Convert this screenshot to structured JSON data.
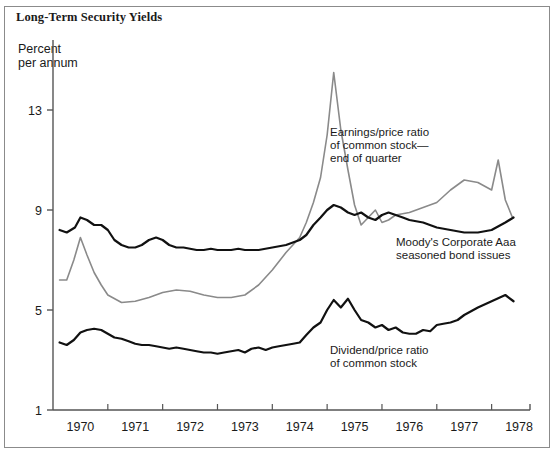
{
  "figure": {
    "title": "Long-Term Security Yields",
    "axis_unit_line1": "Percent",
    "axis_unit_line2": "per annum"
  },
  "colors": {
    "background": "#ffffff",
    "frame": "#8b8b8b",
    "axis": "#555555",
    "text": "#1a1a1a",
    "series_dark": "#111111",
    "series_gray": "#8a8a8a"
  },
  "chart_data": {
    "type": "line",
    "title": "Long-Term Security Yields",
    "xlabel": "",
    "ylabel": "Percent per annum",
    "xlim": [
      1969.5,
      1978.2
    ],
    "ylim": [
      1,
      15
    ],
    "yticks": [
      1,
      5,
      9,
      13
    ],
    "ytick_labels": [
      "1",
      "5",
      "9",
      "13"
    ],
    "xticks": [
      1970,
      1971,
      1972,
      1973,
      1974,
      1975,
      1976,
      1977,
      1978
    ],
    "xtick_labels": [
      "1970",
      "1971",
      "1972",
      "1973",
      "1974",
      "1975",
      "1976",
      "1977",
      "1978"
    ],
    "grid": false,
    "legend_position": "inline-annotations",
    "annotations": [
      {
        "name": "earnings-price-ratio",
        "lines": [
          "Earnings/price ratio",
          "of common stock—",
          "end of quarter"
        ],
        "x": 330,
        "y": 136
      },
      {
        "name": "moodys-corporate-aaa",
        "lines": [
          "Moody's Corporate Aaa",
          "seasoned bond issues"
        ],
        "x": 396,
        "y": 246
      },
      {
        "name": "dividend-price-ratio",
        "lines": [
          "Dividend/price ratio",
          "of common stock"
        ],
        "x": 330,
        "y": 354
      }
    ],
    "series": [
      {
        "name": "Earnings/price ratio of common stock—end of quarter",
        "color": "#8a8a8a",
        "x": [
          1969.62,
          1969.75,
          1969.88,
          1970.0,
          1970.12,
          1970.25,
          1970.38,
          1970.5,
          1970.75,
          1971.0,
          1971.25,
          1971.5,
          1971.75,
          1972.0,
          1972.25,
          1972.5,
          1972.75,
          1973.0,
          1973.25,
          1973.5,
          1973.75,
          1974.0,
          1974.12,
          1974.25,
          1974.38,
          1974.5,
          1974.62,
          1974.75,
          1974.88,
          1975.0,
          1975.12,
          1975.25,
          1975.38,
          1975.5,
          1975.62,
          1975.75,
          1976.0,
          1976.25,
          1976.5,
          1976.75,
          1977.0,
          1977.25,
          1977.5,
          1977.62,
          1977.75,
          1977.88
        ],
        "y": [
          6.2,
          6.2,
          7.0,
          7.9,
          7.2,
          6.5,
          6.0,
          5.6,
          5.3,
          5.35,
          5.5,
          5.7,
          5.8,
          5.75,
          5.6,
          5.5,
          5.5,
          5.6,
          6.0,
          6.6,
          7.3,
          7.9,
          8.5,
          9.3,
          10.3,
          12.0,
          14.5,
          12.2,
          10.6,
          9.2,
          8.4,
          8.7,
          9.0,
          8.5,
          8.6,
          8.8,
          8.9,
          9.1,
          9.3,
          9.8,
          10.2,
          10.1,
          9.8,
          11.0,
          9.4,
          8.7
        ]
      },
      {
        "name": "Moody's Corporate Aaa seasoned bond issues",
        "color": "#111111",
        "x": [
          1969.62,
          1969.75,
          1969.9,
          1970.0,
          1970.12,
          1970.25,
          1970.38,
          1970.5,
          1970.62,
          1970.75,
          1970.88,
          1971.0,
          1971.12,
          1971.25,
          1971.38,
          1971.5,
          1971.62,
          1971.75,
          1971.88,
          1972.0,
          1972.12,
          1972.25,
          1972.38,
          1972.5,
          1972.62,
          1972.75,
          1972.88,
          1973.0,
          1973.25,
          1973.5,
          1973.75,
          1974.0,
          1974.12,
          1974.25,
          1974.38,
          1974.5,
          1974.62,
          1974.75,
          1974.88,
          1975.0,
          1975.12,
          1975.25,
          1975.38,
          1975.5,
          1975.62,
          1975.75,
          1975.88,
          1976.0,
          1976.25,
          1976.5,
          1976.75,
          1977.0,
          1977.25,
          1977.5,
          1977.75,
          1977.9
        ],
        "y": [
          8.2,
          8.1,
          8.3,
          8.7,
          8.6,
          8.4,
          8.4,
          8.2,
          7.8,
          7.6,
          7.5,
          7.5,
          7.6,
          7.8,
          7.9,
          7.8,
          7.6,
          7.5,
          7.5,
          7.45,
          7.4,
          7.4,
          7.45,
          7.4,
          7.4,
          7.4,
          7.45,
          7.4,
          7.4,
          7.5,
          7.6,
          7.8,
          8.0,
          8.4,
          8.7,
          9.0,
          9.2,
          9.1,
          8.9,
          8.8,
          8.9,
          8.7,
          8.6,
          8.8,
          8.9,
          8.8,
          8.7,
          8.6,
          8.5,
          8.3,
          8.2,
          8.1,
          8.1,
          8.2,
          8.5,
          8.7
        ]
      },
      {
        "name": "Dividend/price ratio of common stock",
        "color": "#111111",
        "x": [
          1969.62,
          1969.75,
          1969.88,
          1970.0,
          1970.12,
          1970.25,
          1970.38,
          1970.5,
          1970.62,
          1970.75,
          1970.88,
          1971.0,
          1971.12,
          1971.25,
          1971.38,
          1971.5,
          1971.62,
          1971.75,
          1971.88,
          1972.0,
          1972.12,
          1972.25,
          1972.38,
          1972.5,
          1972.62,
          1972.75,
          1972.88,
          1973.0,
          1973.12,
          1973.25,
          1973.38,
          1973.5,
          1973.62,
          1973.75,
          1973.88,
          1974.0,
          1974.12,
          1974.25,
          1974.38,
          1974.5,
          1974.62,
          1974.75,
          1974.88,
          1975.0,
          1975.12,
          1975.25,
          1975.38,
          1975.5,
          1975.62,
          1975.75,
          1975.88,
          1976.0,
          1976.12,
          1976.25,
          1976.38,
          1976.5,
          1976.62,
          1976.75,
          1976.88,
          1977.0,
          1977.25,
          1977.5,
          1977.75,
          1977.9
        ],
        "y": [
          3.7,
          3.6,
          3.8,
          4.1,
          4.2,
          4.25,
          4.2,
          4.05,
          3.9,
          3.85,
          3.75,
          3.65,
          3.6,
          3.6,
          3.55,
          3.5,
          3.45,
          3.5,
          3.45,
          3.4,
          3.35,
          3.3,
          3.3,
          3.25,
          3.3,
          3.35,
          3.4,
          3.3,
          3.45,
          3.5,
          3.4,
          3.5,
          3.55,
          3.6,
          3.65,
          3.7,
          4.0,
          4.3,
          4.5,
          5.0,
          5.4,
          5.1,
          5.45,
          5.0,
          4.6,
          4.5,
          4.3,
          4.4,
          4.2,
          4.3,
          4.1,
          4.05,
          4.05,
          4.2,
          4.15,
          4.4,
          4.45,
          4.5,
          4.6,
          4.8,
          5.1,
          5.35,
          5.6,
          5.35
        ]
      }
    ]
  }
}
